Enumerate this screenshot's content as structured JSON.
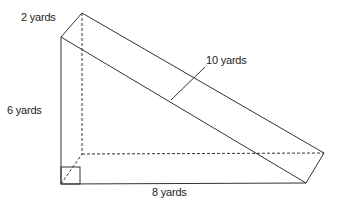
{
  "diagram": {
    "type": "triangular-prism",
    "labels": {
      "depth": "2 yards",
      "height": "6 yards",
      "base": "8 yards",
      "hypotenuse": "10 yards"
    },
    "colors": {
      "line": "#333333",
      "background": "#ffffff"
    }
  }
}
